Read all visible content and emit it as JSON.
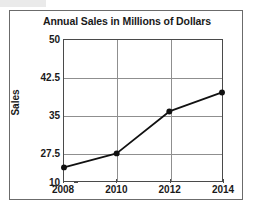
{
  "chart_data": {
    "type": "line",
    "title": "Annual Sales in Millions of Dollars",
    "xlabel": "",
    "ylabel": "Sales",
    "categories": [
      "2008",
      "2010",
      "2012",
      "2014"
    ],
    "x": [
      2008,
      2010,
      2012,
      2014
    ],
    "values": [
      24.5,
      27.3,
      35.7,
      39.5
    ],
    "series": [
      {
        "name": "Sales",
        "values": [
          24.5,
          27.3,
          35.7,
          39.5
        ]
      }
    ],
    "ytick_labels": [
      "50",
      "42.5",
      "35",
      "27.5",
      "10"
    ],
    "ytick_values": [
      50,
      42.5,
      35,
      27.5,
      10
    ],
    "xtick_labels": [
      "2008",
      "2010",
      "2012",
      "2014"
    ],
    "ylim": [
      10,
      50
    ],
    "xlim": [
      2008,
      2014
    ],
    "grid": "both",
    "legend": "none",
    "axis_note": "broken y-axis: segment below 27.5 is compressed down to 10",
    "marker": "filled-circle",
    "line_color": "#111111",
    "grid_color": "#8f8f8f",
    "frame_color": "#4a4a4a",
    "background_color": "#ffffff"
  },
  "figure": {
    "border_color": "#6b6b6b"
  }
}
